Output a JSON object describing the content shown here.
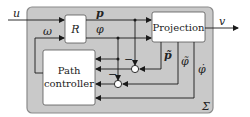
{
  "diagram": {
    "type": "block-diagram",
    "system_label": "Σ",
    "colors": {
      "system_fill": "#c9c9c9",
      "system_border": "#8a8a8a",
      "block_fill": "#ffffff",
      "line": "#1a1a1a"
    },
    "blocks": {
      "R": "R",
      "projection": "Projection",
      "path_controller_line1": "Path",
      "path_controller_line2": "controller"
    },
    "signals": {
      "input_u": "u",
      "output_v": "v",
      "omega": "ω",
      "p": "p",
      "phi": "φ",
      "p_tilde": "p̃",
      "phi_tilde": "φ̃",
      "phi_dot": "φ̇",
      "minus_1": "−",
      "minus_2": "−"
    }
  }
}
